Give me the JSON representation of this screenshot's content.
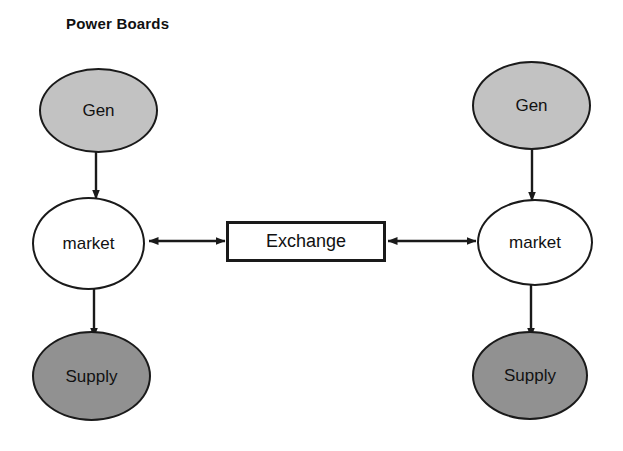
{
  "diagram": {
    "title": "Power Boards",
    "type": "flow-diagram",
    "colors": {
      "generator_fill": "#c2c2c2",
      "supply_fill": "#919191",
      "market_fill": "#ffffff",
      "exchange_fill": "#ffffff",
      "stroke": "#1a1a1a",
      "background": "#ffffff"
    },
    "nodes": {
      "gen_left": {
        "label": "Gen",
        "shape": "ellipse",
        "fill": "light-gray"
      },
      "market_left": {
        "label": "market",
        "shape": "ellipse",
        "fill": "white"
      },
      "supply_left": {
        "label": "Supply",
        "shape": "ellipse",
        "fill": "dark-gray"
      },
      "gen_right": {
        "label": "Gen",
        "shape": "ellipse",
        "fill": "light-gray"
      },
      "market_right": {
        "label": "market",
        "shape": "ellipse",
        "fill": "white"
      },
      "supply_right": {
        "label": "Supply",
        "shape": "ellipse",
        "fill": "dark-gray"
      },
      "exchange": {
        "label": "Exchange",
        "shape": "rectangle",
        "fill": "white"
      }
    },
    "edges": [
      {
        "from": "gen_left",
        "to": "market_left",
        "direction": "one-way",
        "orientation": "vertical"
      },
      {
        "from": "market_left",
        "to": "supply_left",
        "direction": "one-way",
        "orientation": "vertical"
      },
      {
        "from": "market_left",
        "to": "exchange",
        "direction": "two-way",
        "orientation": "horizontal"
      },
      {
        "from": "exchange",
        "to": "market_right",
        "direction": "two-way",
        "orientation": "horizontal"
      },
      {
        "from": "gen_right",
        "to": "market_right",
        "direction": "one-way",
        "orientation": "vertical"
      },
      {
        "from": "market_right",
        "to": "supply_right",
        "direction": "one-way",
        "orientation": "vertical"
      }
    ]
  }
}
